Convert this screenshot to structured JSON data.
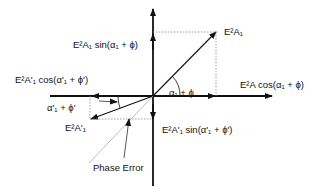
{
  "diagram": {
    "labels": {
      "vector_a1": "E²A₁",
      "sin_component": "E²A₁ sin(α₁ + ϕ)",
      "cos_component": "E²A cos(α₁ + ϕ)",
      "angle_a1": "α₁ + ϕ",
      "vector_a1_prime": "E²A'₁",
      "cos_prime_component": "E²A'₁ cos(α'₁ + ϕ')",
      "angle_a1_prime": "α'₁ + ϕ'",
      "sin_prime_component": "E²A'₁ sin(α'₁ + ϕ')",
      "phase_error": "Phase Error"
    },
    "colors": {
      "axis": "#111111",
      "projection": "#888888",
      "phase_error_line": "#aaaaaa"
    }
  }
}
